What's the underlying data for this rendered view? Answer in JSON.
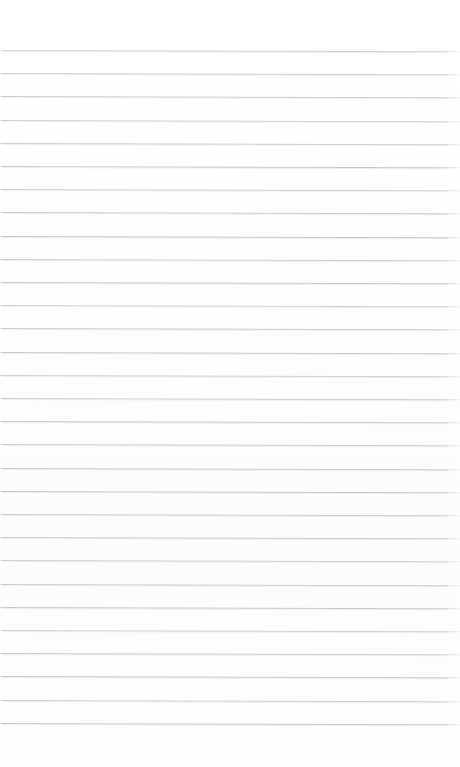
{
  "document": {
    "kind": "ruled-notebook-paper",
    "title": "Blank lined paper",
    "page_width": 460,
    "page_height": 767,
    "background_color": "#fdfdfd",
    "text_content": "",
    "has_text": false,
    "has_margin_rule": false,
    "has_header": false,
    "has_footer": false
  },
  "rules": {
    "count": 30,
    "color": "#c8cacd",
    "thickness_px": 1,
    "first_line_y": 50,
    "spacing_px": 23.2,
    "left_x": 2,
    "right_x": 447,
    "skew_deg": 0.15,
    "y_positions": [
      50,
      73.2,
      96.4,
      119.6,
      142.8,
      166.0,
      189.2,
      212.4,
      235.6,
      258.8,
      282.0,
      305.2,
      328.4,
      351.6,
      374.8,
      398.0,
      421.2,
      444.4,
      467.6,
      490.8,
      514.0,
      537.2,
      560.4,
      583.6,
      606.8,
      630.0,
      653.2,
      676.4,
      699.6,
      722.8
    ]
  }
}
